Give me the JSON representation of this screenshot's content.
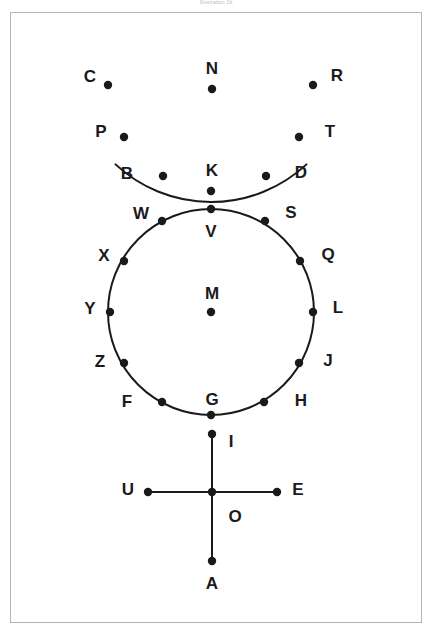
{
  "caption": {
    "text": "Illustration 1b"
  },
  "figure": {
    "background_color": "#ffffff",
    "frame_color": "#b5b5b5",
    "stroke_color": "#1a1a1a",
    "label_color": "#1a1a1a",
    "stroke_width": 2,
    "dot_radius": 4.2
  },
  "shapes": {
    "arc": {
      "name": "upper-arc",
      "type": "arc",
      "center_x": 211,
      "center_y": 62,
      "radius": 140,
      "start_angle_deg": 133,
      "end_angle_deg": 47
    },
    "circle": {
      "name": "main-circle",
      "type": "circle",
      "center_x": 211,
      "center_y": 312,
      "radius": 103
    },
    "vertical_axis": {
      "name": "vertical-axis",
      "type": "line",
      "x1": 212,
      "y1": 434,
      "x2": 212,
      "y2": 561
    },
    "horizontal_axis": {
      "name": "horizontal-axis",
      "type": "line",
      "x1": 148,
      "y1": 492,
      "x2": 277,
      "y2": 492
    }
  },
  "points": [
    {
      "label": "C",
      "x": 108,
      "y": 85,
      "lx": 90,
      "ly": 76,
      "group": "arc"
    },
    {
      "label": "P",
      "x": 124,
      "y": 137,
      "lx": 101,
      "ly": 131,
      "group": "arc"
    },
    {
      "label": "B",
      "x": 163,
      "y": 176,
      "lx": 127,
      "ly": 173,
      "group": "arc"
    },
    {
      "label": "K",
      "x": 211,
      "y": 191,
      "lx": 212,
      "ly": 170,
      "group": "arc"
    },
    {
      "label": "D",
      "x": 266,
      "y": 176,
      "lx": 301,
      "ly": 172,
      "group": "arc"
    },
    {
      "label": "T",
      "x": 299,
      "y": 137,
      "lx": 330,
      "ly": 131,
      "group": "arc"
    },
    {
      "label": "R",
      "x": 313,
      "y": 85,
      "lx": 337,
      "ly": 75,
      "group": "arc"
    },
    {
      "label": "N",
      "x": 212,
      "y": 89,
      "lx": 212,
      "ly": 68,
      "group": "free"
    },
    {
      "label": "V",
      "x": 211,
      "y": 209,
      "lx": 211,
      "ly": 231,
      "group": "circle"
    },
    {
      "label": "W",
      "x": 162,
      "y": 221,
      "lx": 141,
      "ly": 213,
      "group": "circle"
    },
    {
      "label": "X",
      "x": 124,
      "y": 261,
      "lx": 104,
      "ly": 255,
      "group": "circle"
    },
    {
      "label": "Y",
      "x": 110,
      "y": 312,
      "lx": 90,
      "ly": 308,
      "group": "circle"
    },
    {
      "label": "Z",
      "x": 124,
      "y": 363,
      "lx": 100,
      "ly": 361,
      "group": "circle"
    },
    {
      "label": "F",
      "x": 162,
      "y": 402,
      "lx": 127,
      "ly": 401,
      "group": "circle"
    },
    {
      "label": "G",
      "x": 211,
      "y": 415,
      "lx": 212,
      "ly": 399,
      "group": "circle"
    },
    {
      "label": "H",
      "x": 264,
      "y": 402,
      "lx": 301,
      "ly": 400,
      "group": "circle"
    },
    {
      "label": "J",
      "x": 299,
      "y": 363,
      "lx": 328,
      "ly": 360,
      "group": "circle"
    },
    {
      "label": "L",
      "x": 313,
      "y": 312,
      "lx": 338,
      "ly": 307,
      "group": "circle"
    },
    {
      "label": "Q",
      "x": 300,
      "y": 261,
      "lx": 328,
      "ly": 254,
      "group": "circle"
    },
    {
      "label": "S",
      "x": 265,
      "y": 221,
      "lx": 291,
      "ly": 212,
      "group": "circle"
    },
    {
      "label": "M",
      "x": 211,
      "y": 312,
      "lx": 212,
      "ly": 293,
      "group": "center"
    },
    {
      "label": "I",
      "x": 212,
      "y": 434,
      "lx": 231,
      "ly": 441,
      "group": "axis"
    },
    {
      "label": "U",
      "x": 148,
      "y": 492,
      "lx": 128,
      "ly": 489,
      "group": "axis"
    },
    {
      "label": "O",
      "x": 212,
      "y": 492,
      "lx": 235,
      "ly": 516,
      "group": "axis"
    },
    {
      "label": "E",
      "x": 277,
      "y": 492,
      "lx": 298,
      "ly": 489,
      "group": "axis"
    },
    {
      "label": "A",
      "x": 212,
      "y": 561,
      "lx": 212,
      "ly": 583,
      "group": "axis"
    }
  ]
}
